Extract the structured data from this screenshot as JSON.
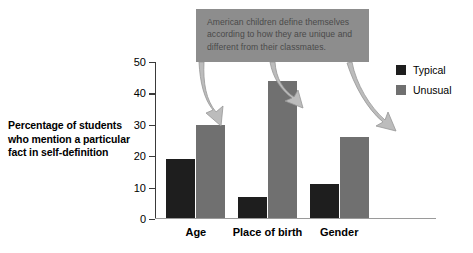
{
  "chart_data": {
    "type": "bar",
    "title": "",
    "subtitle": "",
    "xlabel": "",
    "ylabel": "Percentage of students who mention a particular fact in self-definition",
    "categories": [
      "Age",
      "Place of birth",
      "Gender"
    ],
    "series": [
      {
        "name": "Typical",
        "color": "#1e1e1e",
        "values": [
          19,
          7,
          11
        ]
      },
      {
        "name": "Unusual",
        "color": "#707070",
        "values": [
          30,
          44,
          26
        ]
      }
    ],
    "ylim": [
      0,
      50
    ],
    "yticks": [
      0,
      10,
      20,
      30,
      40,
      50
    ],
    "ytick_labels": [
      "0",
      "10",
      "20",
      "30",
      "40",
      "50"
    ],
    "grid": false,
    "legend_position": "right",
    "annotations": [
      {
        "name": "callout-note",
        "text": "American children define themselves according to how they are unique and different from their classmates.",
        "background": "#8d8d8d",
        "text_color": "#4a4a4a",
        "points_to": [
          "Age / Unusual",
          "Place of birth / Unusual",
          "Gender / Unusual"
        ]
      }
    ]
  },
  "axis": {
    "y_title_line1": "Percentage of students",
    "y_title_line2": "who mention a particular",
    "y_title_line3": "fact in self-definition"
  },
  "legend": {
    "items": [
      {
        "label": "Typical",
        "color": "#1e1e1e"
      },
      {
        "label": "Unusual",
        "color": "#707070"
      }
    ]
  },
  "callout": {
    "text": "American children define themselves according to how they are unique and different from their classmates."
  },
  "colors": {
    "typical": "#1e1e1e",
    "unusual": "#707070",
    "callout_bg": "#8d8d8d",
    "arrow": "#b4b4b4",
    "arrow_edge": "#8f8f8f",
    "axis": "#3a3a3a",
    "background": "#ffffff"
  }
}
